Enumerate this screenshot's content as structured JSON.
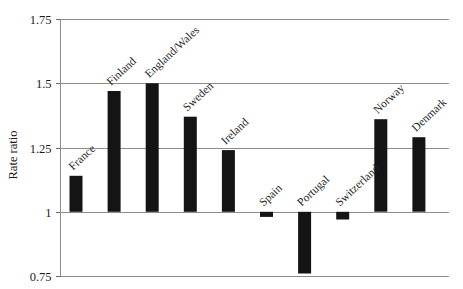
{
  "chart_data": {
    "type": "bar",
    "title": "",
    "xlabel": "",
    "ylabel": "Rate ratio",
    "categories": [
      "France",
      "Finland",
      "England/Wales",
      "Sweden",
      "Ireland",
      "Spain",
      "Portugal",
      "Switzerland",
      "Norway",
      "Denmark"
    ],
    "values": [
      1.14,
      1.47,
      1.5,
      1.37,
      1.24,
      0.98,
      0.76,
      0.97,
      1.36,
      1.29
    ],
    "baseline": 1.0,
    "ylim": [
      0.75,
      1.75
    ],
    "yticks": [
      0.75,
      1.0,
      1.25,
      1.5,
      1.75
    ],
    "ytick_labels": [
      "0.75",
      "1",
      "1.25",
      "1.5",
      "1.75"
    ],
    "grid": true,
    "legend": "none",
    "bar_color": "#141414"
  },
  "axis": {
    "y_label": "Rate ratio"
  }
}
